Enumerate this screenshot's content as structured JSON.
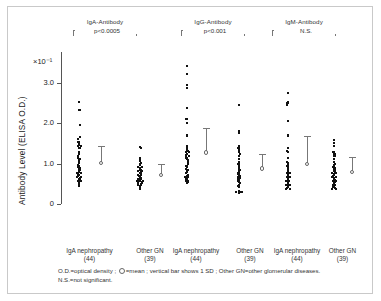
{
  "figure": {
    "y_axis_label": "Antibody Level  (ELISA O.D.)",
    "y_axis_exponent": "×10⁻¹",
    "y_ticks": [
      "3.0",
      "2.0",
      "1.0",
      "0"
    ]
  },
  "groups": [
    {
      "title": "IgA-Antibody",
      "significance": "p<0.0005",
      "columns": [
        {
          "label": "IgA nephropathy",
          "count": "(44)"
        },
        {
          "label": "Other GN",
          "count": "(39)"
        }
      ]
    },
    {
      "title": "IgG-Antibody",
      "significance": "p<0.001",
      "columns": [
        {
          "label": "IgA nephropathy",
          "count": "(44)"
        },
        {
          "label": "Other GN",
          "count": "(39)"
        }
      ]
    },
    {
      "title": "IgM-Antibody",
      "significance": "N.S.",
      "columns": [
        {
          "label": "IgA nephropathy",
          "count": "(44)"
        },
        {
          "label": "Other GN",
          "count": "(39)"
        }
      ]
    }
  ],
  "footnote": {
    "line1_a": "O.D.=optical density ;",
    "line1_b": "=mean ; vertical bar shows 1 SD ; Other GN=other glomerular diseases.",
    "line2": "N.S.=not significant."
  },
  "chart_data": {
    "type": "scatter",
    "title": "",
    "xlabel": "",
    "ylabel": "Antibody Level  (ELISA O.D.)",
    "y_unit_multiplier": "×10⁻¹",
    "ylim": [
      0,
      3.8
    ],
    "yticks": [
      0,
      1.0,
      2.0,
      3.0
    ],
    "grid": false,
    "legend": "none",
    "series": [
      {
        "name": "IgA-Antibody / IgA nephropathy",
        "group": "IgA-Antibody",
        "n": 44,
        "mean": 1.01,
        "sd": 0.42,
        "values": [
          2.54,
          2.34,
          1.95,
          1.67,
          1.62,
          1.55,
          1.52,
          1.5,
          1.47,
          1.45,
          1.43,
          1.4,
          1.3,
          1.25,
          1.2,
          1.15,
          1.12,
          1.08,
          1.05,
          1.02,
          0.98,
          0.95,
          0.92,
          0.9,
          0.88,
          0.85,
          0.83,
          0.8,
          0.78,
          0.76,
          0.74,
          0.72,
          0.7,
          0.68,
          0.66,
          0.64,
          0.62,
          0.6,
          0.58,
          0.56,
          0.54,
          0.52,
          0.48,
          0.45
        ]
      },
      {
        "name": "IgA-Antibody / Other GN",
        "group": "IgA-Antibody",
        "n": 39,
        "mean": 0.72,
        "sd": 0.27,
        "values": [
          1.41,
          1.38,
          1.13,
          1.1,
          1.06,
          1.02,
          0.99,
          0.96,
          0.93,
          0.91,
          0.89,
          0.87,
          0.85,
          0.83,
          0.81,
          0.79,
          0.77,
          0.75,
          0.73,
          0.71,
          0.69,
          0.67,
          0.65,
          0.63,
          0.61,
          0.59,
          0.58,
          0.57,
          0.56,
          0.55,
          0.54,
          0.53,
          0.52,
          0.5,
          0.48,
          0.46,
          0.44,
          0.4,
          0.37
        ]
      },
      {
        "name": "IgG-Antibody / IgA nephropathy",
        "group": "IgG-Antibody",
        "n": 44,
        "mean": 1.28,
        "sd": 0.61,
        "values": [
          3.42,
          3.22,
          2.95,
          2.87,
          2.37,
          2.1,
          2.02,
          1.7,
          1.68,
          1.45,
          1.42,
          1.38,
          1.35,
          1.32,
          1.3,
          1.28,
          1.25,
          1.22,
          1.2,
          1.18,
          1.15,
          1.12,
          1.08,
          1.05,
          1.02,
          1.0,
          0.95,
          0.92,
          0.88,
          0.85,
          0.82,
          0.79,
          0.76,
          0.73,
          0.7,
          0.68,
          0.66,
          0.64,
          0.62,
          0.6,
          0.58,
          0.56,
          0.54,
          0.52
        ]
      },
      {
        "name": "IgG-Antibody / Other GN",
        "group": "IgG-Antibody",
        "n": 39,
        "mean": 0.88,
        "sd": 0.37,
        "values": [
          2.45,
          1.82,
          1.76,
          1.45,
          1.4,
          1.35,
          1.3,
          1.25,
          1.18,
          1.12,
          1.05,
          1.0,
          0.98,
          0.95,
          0.92,
          0.9,
          0.88,
          0.85,
          0.82,
          0.8,
          0.78,
          0.75,
          0.72,
          0.7,
          0.68,
          0.65,
          0.62,
          0.6,
          0.58,
          0.55,
          0.52,
          0.48,
          0.45,
          0.42,
          0.32,
          0.31,
          0.3,
          0.29,
          0.28
        ]
      },
      {
        "name": "IgM-Antibody / IgA nephropathy",
        "group": "IgM-Antibody",
        "n": 44,
        "mean": 1.0,
        "sd": 0.68,
        "values": [
          2.76,
          2.53,
          2.5,
          2.45,
          2.05,
          1.7,
          1.68,
          1.4,
          1.32,
          1.28,
          1.15,
          1.05,
          1.02,
          1.0,
          0.98,
          0.95,
          0.92,
          0.9,
          0.88,
          0.85,
          0.83,
          0.8,
          0.78,
          0.76,
          0.74,
          0.72,
          0.7,
          0.68,
          0.66,
          0.64,
          0.62,
          0.6,
          0.58,
          0.56,
          0.54,
          0.52,
          0.5,
          0.48,
          0.46,
          0.44,
          0.42,
          0.4,
          0.38,
          0.36
        ]
      },
      {
        "name": "IgM-Antibody / Other GN",
        "group": "IgM-Antibody",
        "n": 39,
        "mean": 0.8,
        "sd": 0.37,
        "values": [
          1.58,
          1.52,
          1.45,
          1.3,
          1.25,
          1.18,
          1.12,
          1.05,
          1.0,
          0.98,
          0.95,
          0.92,
          0.9,
          0.88,
          0.85,
          0.82,
          0.8,
          0.78,
          0.76,
          0.74,
          0.72,
          0.7,
          0.68,
          0.66,
          0.64,
          0.62,
          0.6,
          0.58,
          0.56,
          0.54,
          0.52,
          0.5,
          0.48,
          0.46,
          0.44,
          0.42,
          0.4,
          0.38,
          0.36
        ]
      }
    ]
  }
}
